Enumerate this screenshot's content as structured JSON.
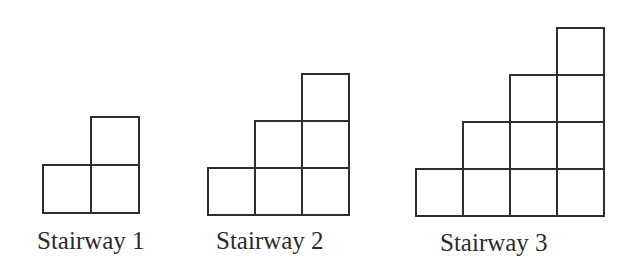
{
  "figure": {
    "stairways": [
      {
        "label": "Stairway 1",
        "steps": 2,
        "cell_size": 48,
        "origin": {
          "left": 43,
          "bottom": 213
        },
        "label_pos": {
          "left": 37,
          "top": 228
        }
      },
      {
        "label": "Stairway 2",
        "steps": 3,
        "cell_size": 47,
        "origin": {
          "left": 208,
          "bottom": 215
        },
        "label_pos": {
          "left": 216,
          "top": 228
        }
      },
      {
        "label": "Stairway 3",
        "steps": 4,
        "cell_size": 47,
        "origin": {
          "left": 416,
          "bottom": 216
        },
        "label_pos": {
          "left": 440,
          "top": 230
        }
      }
    ],
    "line_color": "#2e2e2e"
  }
}
